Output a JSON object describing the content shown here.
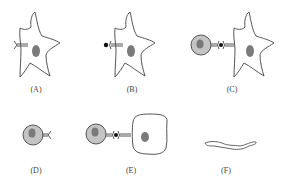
{
  "panels": [
    {
      "id": "A",
      "label": "(A)",
      "description": "dendritic cell with receptor"
    },
    {
      "id": "B",
      "label": "(B)",
      "description": "dendritic cell with receptor bound to antigen"
    },
    {
      "id": "C",
      "label": "(C)",
      "description": "lymphocyte receptor binding antigen presented by dendritic cell"
    },
    {
      "id": "D",
      "label": "(D)",
      "description": "lymphocyte with receptor"
    },
    {
      "id": "E",
      "label": "(E)",
      "description": "lymphocyte binding antigen presented by rounded cell"
    },
    {
      "id": "F",
      "label": "(F)",
      "description": "shriveled cell remnant"
    }
  ],
  "colors": {
    "outline": "#555555",
    "nucleus": "#7a7a7a",
    "lymphocyte_body": "#c4c4c4",
    "antigen": "#111111",
    "label": "#444444"
  }
}
